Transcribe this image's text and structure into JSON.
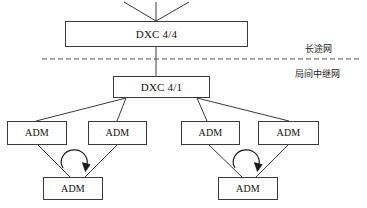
{
  "diagram": {
    "background_color": "#ffffff",
    "line_color": "#3a3a3a",
    "text_color": "#101010",
    "nodes": {
      "dxc44": {
        "label": "DXC 4/4"
      },
      "dxc41": {
        "label": "DXC 4/1"
      },
      "adm_left_1": {
        "label": "ADM"
      },
      "adm_left_2": {
        "label": "ADM"
      },
      "adm_left_3": {
        "label": "ADM"
      },
      "adm_right_1": {
        "label": "ADM"
      },
      "adm_right_2": {
        "label": "ADM"
      },
      "adm_right_3": {
        "label": "ADM"
      }
    },
    "zones": {
      "upper": {
        "label": "长途网"
      },
      "lower": {
        "label": "局间中继网"
      }
    },
    "separator": {
      "style": "dashed"
    },
    "ring_arrows": [
      {
        "name": "left-ring-direction",
        "direction": "clockwise"
      },
      {
        "name": "right-ring-direction",
        "direction": "clockwise"
      }
    ]
  }
}
